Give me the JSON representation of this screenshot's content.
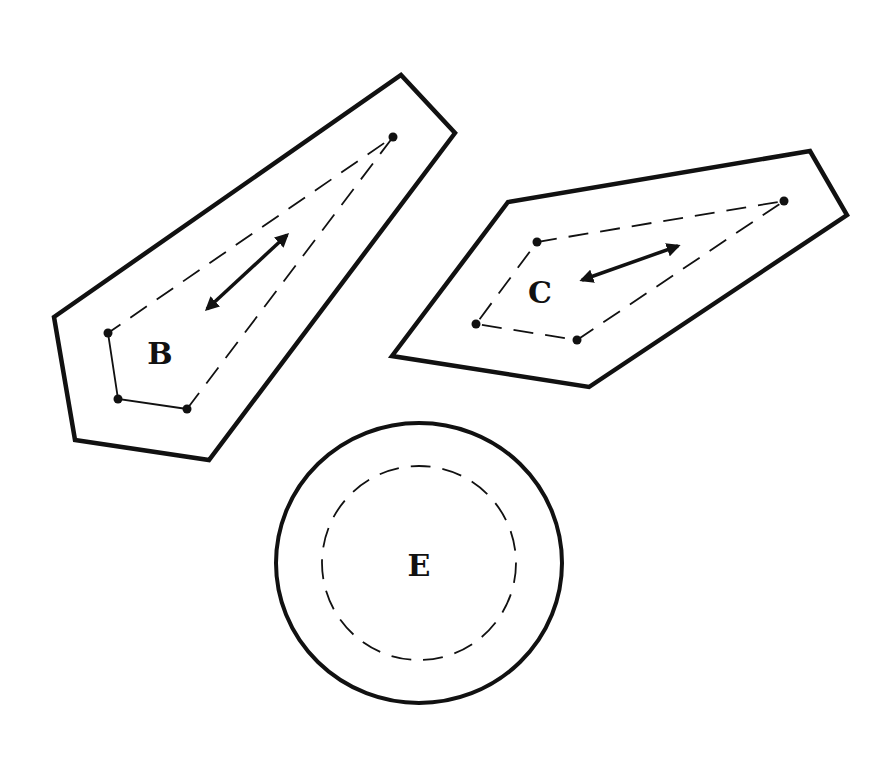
{
  "diagram": {
    "shapes": [
      {
        "id": "B",
        "label": "B",
        "type": "polygon-region",
        "outline": [
          [
            54,
            317
          ],
          [
            401,
            75
          ],
          [
            455,
            133
          ],
          [
            209,
            460
          ],
          [
            75,
            440
          ]
        ],
        "inner_points": [
          [
            108,
            333
          ],
          [
            118,
            399
          ],
          [
            187,
            409
          ],
          [
            393,
            137
          ]
        ],
        "arrow": {
          "from": [
            204,
            312
          ],
          "to": [
            290,
            232
          ],
          "double_headed": true
        },
        "label_pos": [
          160,
          364
        ]
      },
      {
        "id": "C",
        "label": "C",
        "type": "polygon-region",
        "outline": [
          [
            392,
            356
          ],
          [
            508,
            202
          ],
          [
            810,
            151
          ],
          [
            847,
            215
          ],
          [
            589,
            387
          ]
        ],
        "inner_points": [
          [
            537,
            242
          ],
          [
            784,
            201
          ],
          [
            577,
            340
          ],
          [
            476,
            324
          ]
        ],
        "arrow": {
          "from": [
            578,
            281
          ],
          "to": [
            682,
            244
          ],
          "double_headed": true
        },
        "label_pos": [
          540,
          303
        ]
      },
      {
        "id": "E",
        "label": "E",
        "type": "circle-region",
        "center": [
          419,
          563
        ],
        "outer_radius": 142,
        "inner_dashed_radius": 97,
        "label_pos": [
          419,
          576
        ]
      }
    ],
    "colors": {
      "stroke": "#111111",
      "background": "#ffffff"
    }
  }
}
